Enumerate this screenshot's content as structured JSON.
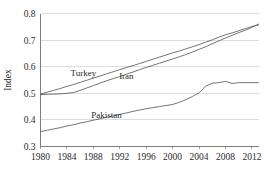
{
  "chart_data": {
    "type": "line",
    "title": "",
    "subtitle": "",
    "xlabel": "",
    "ylabel": "Index",
    "xlim": [
      1980,
      2013
    ],
    "ylim": [
      0.3,
      0.8
    ],
    "grid": true,
    "legend_position": "inline-labels",
    "x_tick_labels": [
      "1980",
      "1984",
      "1988",
      "1992",
      "1996",
      "2000",
      "2004",
      "2008",
      "2012"
    ],
    "x_ticks": [
      1980,
      1984,
      1988,
      1992,
      1996,
      2000,
      2004,
      2008,
      2012
    ],
    "y_tick_labels": [
      "0.3",
      "0.4",
      "0.5",
      "0.6",
      "0.7",
      "0.8"
    ],
    "y_ticks": [
      0.3,
      0.4,
      0.5,
      0.6,
      0.7,
      0.8
    ],
    "x": [
      1980,
      1981,
      1982,
      1983,
      1984,
      1985,
      1986,
      1987,
      1988,
      1989,
      1990,
      1991,
      1992,
      1993,
      1994,
      1995,
      1996,
      1997,
      1998,
      1999,
      2000,
      2001,
      2002,
      2003,
      2004,
      2005,
      2006,
      2007,
      2008,
      2009,
      2010,
      2011,
      2012,
      2013
    ],
    "series": [
      {
        "name": "Turkey",
        "color": "#5b5b5b",
        "label_x": 1986.5,
        "label_y": 0.565,
        "values": [
          0.497,
          0.504,
          0.511,
          0.518,
          0.526,
          0.533,
          0.541,
          0.549,
          0.557,
          0.565,
          0.573,
          0.581,
          0.589,
          0.597,
          0.604,
          0.612,
          0.62,
          0.628,
          0.636,
          0.644,
          0.652,
          0.659,
          0.667,
          0.675,
          0.683,
          0.692,
          0.701,
          0.711,
          0.72,
          0.727,
          0.735,
          0.743,
          0.751,
          0.757
        ]
      },
      {
        "name": "Iran",
        "color": "#5b5b5b",
        "label_x": 1993.0,
        "label_y": 0.553,
        "values": [
          0.495,
          0.496,
          0.497,
          0.498,
          0.5,
          0.503,
          0.511,
          0.52,
          0.529,
          0.538,
          0.547,
          0.555,
          0.563,
          0.572,
          0.58,
          0.589,
          0.597,
          0.605,
          0.613,
          0.621,
          0.629,
          0.637,
          0.646,
          0.655,
          0.665,
          0.675,
          0.686,
          0.697,
          0.708,
          0.718,
          0.728,
          0.737,
          0.748,
          0.76
        ]
      },
      {
        "name": "Pakistan",
        "color": "#5b5b5b",
        "label_x": 1990.0,
        "label_y": 0.408,
        "values": [
          0.356,
          0.361,
          0.366,
          0.371,
          0.377,
          0.382,
          0.388,
          0.393,
          0.399,
          0.404,
          0.41,
          0.415,
          0.421,
          0.426,
          0.432,
          0.437,
          0.442,
          0.446,
          0.45,
          0.454,
          0.458,
          0.466,
          0.476,
          0.488,
          0.502,
          0.527,
          0.538,
          0.54,
          0.545,
          0.537,
          0.54,
          0.54,
          0.54,
          0.54
        ]
      }
    ]
  }
}
